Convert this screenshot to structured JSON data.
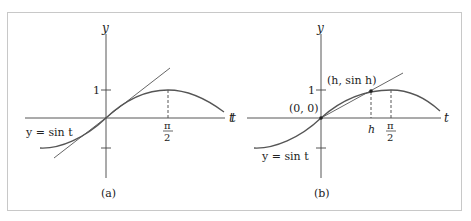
{
  "figure": {
    "panels": [
      {
        "id": "a",
        "caption": "(a)",
        "y_axis_label": "y",
        "t_axis_label": "t",
        "tick_one_label": "1",
        "pi_over_2_num": "π",
        "pi_over_2_den": "2",
        "curve_label": "y = sin t",
        "elements": [
          "sine curve",
          "tangent line at origin",
          "dashed line at t = π/2"
        ]
      },
      {
        "id": "b",
        "caption": "(b)",
        "y_axis_label": "y",
        "t_axis_label": "t",
        "left_t_label": "t",
        "tick_one_label": "1",
        "pi_over_2_num": "π",
        "pi_over_2_den": "2",
        "h_label": "h",
        "origin_label": "(0, 0)",
        "point_label": "(h, sin h)",
        "curve_label": "y = sin t",
        "elements": [
          "sine curve",
          "secant line from (0,0) through (h, sin h)",
          "dashed lines at t = h and t = π/2"
        ]
      }
    ],
    "colors": {
      "curve": "#555555",
      "axis": "#444444",
      "frame": "#c8c8c8",
      "text": "#222222"
    }
  }
}
